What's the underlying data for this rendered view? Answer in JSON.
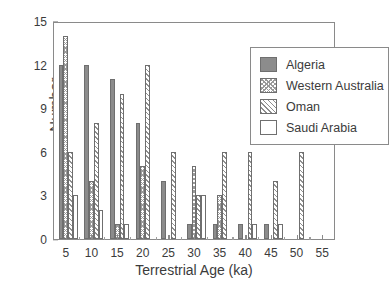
{
  "chart_data": {
    "type": "bar",
    "title": "",
    "xlabel": "Terrestrial Age (ka)",
    "ylabel": "Number",
    "categories": [
      5,
      10,
      15,
      20,
      25,
      30,
      35,
      40,
      45,
      50,
      55
    ],
    "xtick_labels": [
      "5",
      "10",
      "15",
      "20",
      "25",
      "30",
      "35",
      "40",
      "45",
      "50",
      "55"
    ],
    "ytick_labels": [
      "0",
      "3",
      "6",
      "9",
      "12",
      "15"
    ],
    "ytick_values": [
      0,
      3,
      6,
      9,
      12,
      15
    ],
    "ylim": [
      0,
      15
    ],
    "xlim": [
      2.5,
      57.5
    ],
    "grid": false,
    "legend_position": "top-right",
    "series": [
      {
        "name": "Algeria",
        "pattern": "solid-gray",
        "color": "#8c8c8c",
        "values": [
          12,
          12,
          11,
          8,
          4,
          1,
          1,
          1,
          1,
          0,
          0
        ]
      },
      {
        "name": "Western Australia",
        "pattern": "stipple",
        "color": "#9a9a9a",
        "values": [
          14,
          4,
          1,
          5,
          0,
          5,
          3,
          0,
          0,
          0,
          0
        ]
      },
      {
        "name": "Oman",
        "pattern": "diagonal-hatch",
        "color": "#8f8f8f",
        "values": [
          6,
          8,
          10,
          12,
          6,
          3,
          6,
          6,
          4,
          6,
          0
        ]
      },
      {
        "name": "Saudi Arabia",
        "pattern": "open-white",
        "color": "#ffffff",
        "values": [
          3,
          2,
          1,
          0,
          0,
          3,
          0,
          1,
          1,
          0,
          0
        ]
      }
    ]
  },
  "legend": {
    "items": [
      {
        "label": "Algeria",
        "key": "algeria"
      },
      {
        "label": "Western Australia",
        "key": "western-australia"
      },
      {
        "label": "Oman",
        "key": "oman"
      },
      {
        "label": "Saudi Arabia",
        "key": "saudi-arabia"
      }
    ]
  }
}
